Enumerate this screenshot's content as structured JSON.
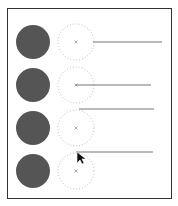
{
  "canvas": {
    "border_color": "#333333",
    "filled_color": "#555555",
    "dotted_color": "#bbbbbb",
    "line_color": "#777777"
  },
  "rows": [
    {
      "filled": {
        "cx": 33,
        "cy": 42,
        "r": 17
      },
      "dotted": {
        "cx": 76,
        "cy": 42,
        "r": 18,
        "center_marker": "x"
      },
      "line": {
        "x1": 93,
        "y1": 42,
        "x2": 162,
        "y2": 42
      }
    },
    {
      "filled": {
        "cx": 33,
        "cy": 85,
        "r": 17
      },
      "dotted": {
        "cx": 76,
        "cy": 85,
        "r": 18,
        "center_marker": "x"
      },
      "line": {
        "x1": 76,
        "y1": 85,
        "x2": 151,
        "y2": 85
      }
    },
    {
      "filled": {
        "cx": 33,
        "cy": 128,
        "r": 17
      },
      "dotted": {
        "cx": 76,
        "cy": 128,
        "r": 18,
        "center_marker": "x"
      },
      "line": {
        "x1": 79,
        "y1": 109,
        "x2": 154,
        "y2": 109
      }
    },
    {
      "filled": {
        "cx": 33,
        "cy": 171,
        "r": 17
      },
      "dotted": {
        "cx": 76,
        "cy": 171,
        "r": 18,
        "center_marker": "x"
      },
      "line": {
        "x1": 76,
        "y1": 152,
        "x2": 153,
        "y2": 152
      }
    }
  ],
  "cursor": {
    "x": 77,
    "y": 152,
    "type": "arrow"
  }
}
